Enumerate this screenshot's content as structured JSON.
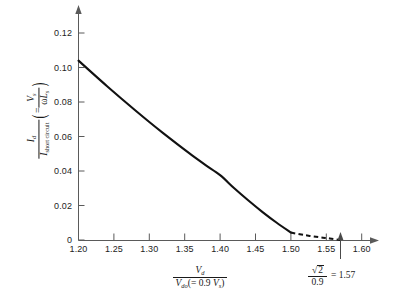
{
  "chart_data": {
    "type": "line",
    "title": "",
    "xlabel": "Vd / Vdo(= 0.9 Vs)",
    "ylabel": "Id / I short circuit (= Vs / wLs)",
    "xlim": [
      1.2,
      1.62
    ],
    "ylim": [
      0,
      0.13
    ],
    "grid": false,
    "legend": null,
    "xticks": [
      "1.20",
      "1.25",
      "1.30",
      "1.35",
      "1.40",
      "1.45",
      "1.50",
      "1.55",
      "1.60"
    ],
    "xtick_values": [
      1.2,
      1.25,
      1.3,
      1.35,
      1.4,
      1.45,
      1.5,
      1.55,
      1.6
    ],
    "yticks": [
      "0",
      "0.02",
      "0.04",
      "0.06",
      "0.08",
      "0.10",
      "0.12"
    ],
    "ytick_values": [
      0,
      0.02,
      0.04,
      0.06,
      0.08,
      0.1,
      0.12
    ],
    "series": [
      {
        "name": "Id/Ishort-circuit (solid)",
        "style": "solid",
        "x": [
          1.2,
          1.22,
          1.24,
          1.26,
          1.28,
          1.3,
          1.32,
          1.34,
          1.36,
          1.38,
          1.4,
          1.42,
          1.44,
          1.46,
          1.48,
          1.5
        ],
        "values": [
          0.104,
          0.0966,
          0.0893,
          0.0822,
          0.0752,
          0.0684,
          0.0618,
          0.0554,
          0.0492,
          0.0433,
          0.0376,
          0.03,
          0.0229,
          0.0162,
          0.01,
          0.0043
        ]
      },
      {
        "name": "Id/Ishort-circuit (dashed extrapolation)",
        "style": "dashed",
        "x": [
          1.5,
          1.52,
          1.54,
          1.555,
          1.57
        ],
        "values": [
          0.0043,
          0.0028,
          0.0016,
          0.0009,
          0.0
        ]
      }
    ],
    "annotations": [
      {
        "name": "sqrt2-over-0.9-marker",
        "x_value": 1.57,
        "marker": "up-arrow",
        "text": "√2 / 0.9 = 1.57"
      }
    ]
  },
  "labels": {
    "y_numerator_var": "I",
    "y_numerator_sub": "d",
    "y_denominator_var": "I",
    "y_denominator_sub": "short circuit",
    "y_paren_equals": "=",
    "y_paren_num_var": "V",
    "y_paren_num_sub": "s",
    "y_paren_den_omega": "ω",
    "y_paren_den_var": "L",
    "y_paren_den_sub": "s",
    "x_numerator_var": "V",
    "x_numerator_sub": "d",
    "x_denominator_var": "V",
    "x_denominator_sub": "do",
    "x_denominator_rest_open": "(= 0.9 ",
    "x_denominator_rest_var": "V",
    "x_denominator_rest_sub": "s",
    "x_denominator_rest_close": ")",
    "note_radicand": "2",
    "note_denominator": "0.9",
    "note_equals_value": "= 1.57"
  },
  "style": {
    "curve_color": "#111111",
    "axis_color": "#5a5a5a",
    "text_color": "#1d1d1d",
    "background": "#ffffff"
  }
}
